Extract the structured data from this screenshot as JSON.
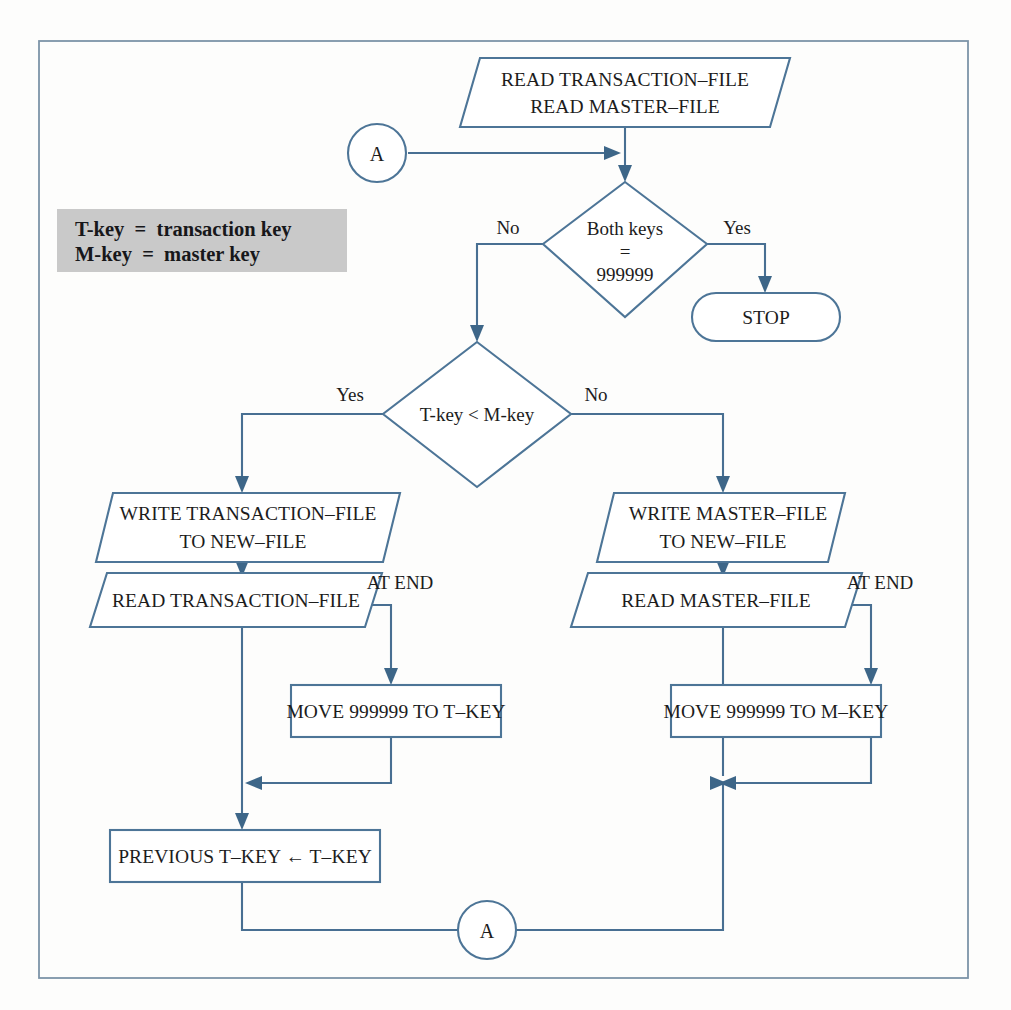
{
  "diagram": {
    "frame": {
      "stroke": "#7d94a8"
    },
    "line_color": "#4d7597",
    "text_color": "#1c1c1c",
    "legend": {
      "background": "#c9c9c9",
      "line1": "T-key  =  transaction key",
      "line2": "M-key  =  master key"
    },
    "nodes": {
      "read_files": {
        "shape": "parallelogram",
        "line1": "READ TRANSACTION–FILE",
        "line2": "READ MASTER–FILE"
      },
      "connector_a_top": {
        "shape": "circle",
        "label": "A"
      },
      "decision_both_keys": {
        "shape": "diamond",
        "line1": "Both keys",
        "line2": "=",
        "line3": "999999"
      },
      "stop": {
        "shape": "terminator",
        "label": "STOP"
      },
      "decision_compare": {
        "shape": "diamond",
        "label": "T-key  <  M-key"
      },
      "write_transaction": {
        "shape": "parallelogram",
        "line1": "WRITE TRANSACTION–FILE",
        "line2": "TO NEW–FILE"
      },
      "write_master": {
        "shape": "parallelogram",
        "line1": "WRITE MASTER–FILE",
        "line2": "TO NEW–FILE"
      },
      "read_transaction": {
        "shape": "parallelogram",
        "label": "READ TRANSACTION–FILE"
      },
      "read_master": {
        "shape": "parallelogram",
        "label": "READ MASTER–FILE"
      },
      "move_t_key": {
        "shape": "process",
        "label": "MOVE 999999 TO T–KEY"
      },
      "move_m_key": {
        "shape": "process",
        "label": "MOVE 999999 TO M–KEY"
      },
      "previous_t_key": {
        "shape": "process",
        "label": "PREVIOUS T–KEY ← T–KEY"
      },
      "connector_a_bottom": {
        "shape": "circle",
        "label": "A"
      }
    },
    "edge_labels": {
      "both_keys_no": "No",
      "both_keys_yes": "Yes",
      "compare_yes": "Yes",
      "compare_no": "No",
      "at_end_left": "AT END",
      "at_end_right": "AT END"
    }
  }
}
